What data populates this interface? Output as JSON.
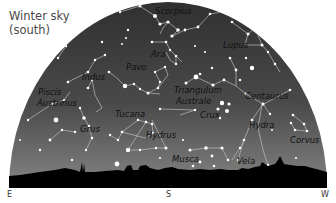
{
  "title": {
    "line1": "Winter sky",
    "line2": "(south)"
  },
  "directions": {
    "east": "E",
    "south": "S",
    "west": "W"
  },
  "colors": {
    "sky_top": "#343434",
    "sky_horizon": "#808080",
    "horizon_silhouette": "#000000",
    "star": "#ffffff",
    "constellation_line": "#c8c8c8",
    "label": "#111111"
  },
  "constellations": [
    {
      "name": "Scorpius",
      "x": 170,
      "y": 12
    },
    {
      "name": "Ara",
      "x": 151,
      "y": 54
    },
    {
      "name": "Lupus",
      "x": 234,
      "y": 47
    },
    {
      "name": "Pavo",
      "x": 126,
      "y": 69
    },
    {
      "name": "Indus",
      "x": 81,
      "y": 77
    },
    {
      "name": "Piscis",
      "x": 37,
      "y": 93
    },
    {
      "name": "Austrinus",
      "x": 37,
      "y": 104
    },
    {
      "name": "Triangulum",
      "x": 174,
      "y": 93
    },
    {
      "name": "Australe",
      "x": 174,
      "y": 103
    },
    {
      "name": "Centaurus",
      "x": 246,
      "y": 98
    },
    {
      "name": "Crux",
      "x": 200,
      "y": 116
    },
    {
      "name": "Tucana",
      "x": 114,
      "y": 115
    },
    {
      "name": "Hydra",
      "x": 249,
      "y": 127
    },
    {
      "name": "Grus",
      "x": 79,
      "y": 131
    },
    {
      "name": "Hydrus",
      "x": 145,
      "y": 136
    },
    {
      "name": "Corvus",
      "x": 290,
      "y": 142
    },
    {
      "name": "Musca",
      "x": 172,
      "y": 160
    },
    {
      "name": "Vela",
      "x": 237,
      "y": 162
    }
  ]
}
